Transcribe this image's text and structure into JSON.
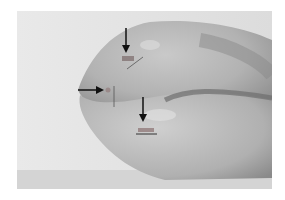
{
  "image": {
    "subject": "grayscale photograph of a specimen with three arrows marking spots",
    "background_color": "#ffffff",
    "photo_bg_color": "#e6e6e6",
    "annotations": [
      {
        "type": "arrow",
        "direction": "down",
        "label": "arrow-top"
      },
      {
        "type": "arrow",
        "direction": "right",
        "label": "arrow-left"
      },
      {
        "type": "arrow",
        "direction": "down",
        "label": "arrow-bottom"
      }
    ]
  }
}
